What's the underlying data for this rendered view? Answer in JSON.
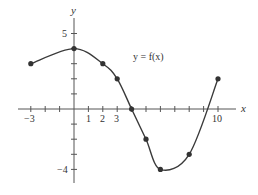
{
  "chart_data": {
    "type": "line",
    "title": "",
    "annotation": "y = f(x)",
    "xlabel": "x",
    "ylabel": "y",
    "xlim": [
      -3,
      10
    ],
    "ylim": [
      -4,
      5
    ],
    "grid": false,
    "legend": null,
    "x_ticks": [
      -3,
      -2,
      -1,
      0,
      1,
      2,
      3,
      4,
      5,
      6,
      7,
      8,
      9,
      10
    ],
    "x_tick_labels": [
      {
        "value": -3,
        "label": "−3"
      },
      {
        "value": 1,
        "label": "1"
      },
      {
        "value": 2,
        "label": "2"
      },
      {
        "value": 3,
        "label": "3"
      },
      {
        "value": 10,
        "label": "10"
      }
    ],
    "y_ticks": [
      -4,
      -3,
      -2,
      -1,
      0,
      1,
      2,
      3,
      4,
      5
    ],
    "y_tick_labels": [
      {
        "value": 5,
        "label": "5"
      },
      {
        "value": -4,
        "label": "−4"
      }
    ],
    "series": [
      {
        "name": "f(x)",
        "color": "#333333",
        "marked_points": [
          {
            "x": -3,
            "y": 3
          },
          {
            "x": 0,
            "y": 4
          },
          {
            "x": 2,
            "y": 3
          },
          {
            "x": 3,
            "y": 2
          },
          {
            "x": 4,
            "y": 0
          },
          {
            "x": 5,
            "y": -2
          },
          {
            "x": 6,
            "y": -4
          },
          {
            "x": 8,
            "y": -3
          },
          {
            "x": 10,
            "y": 2
          }
        ]
      }
    ]
  },
  "labels": {
    "function": "y = f(x)",
    "x_axis": "x",
    "y_axis": "y",
    "y5": "5",
    "yneg4": "−4",
    "xneg3": "−3",
    "x1": "1",
    "x2": "2",
    "x3": "3",
    "x10": "10"
  }
}
